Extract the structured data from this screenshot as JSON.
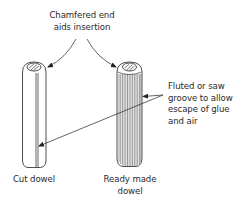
{
  "diagram": {
    "colors": {
      "line": "#222222",
      "background": "#ffffff",
      "text": "#2a2a2a"
    },
    "labels": {
      "chamfer": {
        "line1": "Chamfered end",
        "line2": "aids insertion"
      },
      "groove": {
        "line1": "Fluted or saw",
        "line2": "groove to allow",
        "line3": "escape of glue",
        "line4": "and air"
      },
      "cut_dowel": "Cut dowel",
      "ready_made": {
        "line1": "Ready made",
        "line2": "dowel"
      }
    },
    "parts": [
      {
        "id": "cut-dowel",
        "type": "cylinder",
        "feature": "single saw groove"
      },
      {
        "id": "ready-made-dowel",
        "type": "cylinder",
        "feature": "fluted surface"
      }
    ]
  }
}
